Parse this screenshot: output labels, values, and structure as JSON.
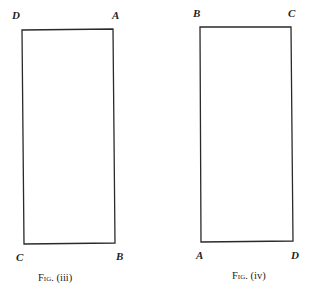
{
  "figures": [
    {
      "id": "fig-iii",
      "caption": "Fig. (iii)",
      "caption_prefix": "Fig.",
      "caption_suffix": "(iii)",
      "shape": "rectangle",
      "corners": {
        "top_left": {
          "label": "D",
          "x": 22,
          "y": 30
        },
        "top_right": {
          "label": "A",
          "x": 113,
          "y": 29
        },
        "bottom_right": {
          "label": "B",
          "x": 115,
          "y": 243
        },
        "bottom_left": {
          "label": "C",
          "x": 24,
          "y": 244
        }
      }
    },
    {
      "id": "fig-iv",
      "caption": "Fig. (iv)",
      "caption_prefix": "Fig.",
      "caption_suffix": "(iv)",
      "shape": "rectangle",
      "corners": {
        "top_left": {
          "label": "B",
          "x": 200,
          "y": 27
        },
        "top_right": {
          "label": "C",
          "x": 291,
          "y": 27
        },
        "bottom_right": {
          "label": "D",
          "x": 293,
          "y": 241
        },
        "bottom_left": {
          "label": "A",
          "x": 201,
          "y": 242
        }
      }
    }
  ],
  "style": {
    "line_color": "#2a2a2a",
    "background": "#ffffff"
  }
}
